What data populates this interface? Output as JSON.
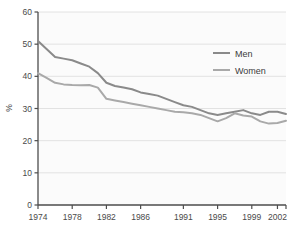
{
  "chart_data": {
    "type": "line",
    "title": "",
    "subtitle": "",
    "xlabel": "",
    "ylabel": "%",
    "xlim": [
      1974,
      2003
    ],
    "ylim": [
      0,
      60
    ],
    "ytick_values": [
      0,
      10,
      20,
      30,
      40,
      50,
      60
    ],
    "ytick_labels": [
      "0",
      "10",
      "20",
      "30",
      "40",
      "50",
      "60"
    ],
    "xtick_values": [
      1974,
      1978,
      1982,
      1986,
      1991,
      1995,
      1999,
      2002
    ],
    "xtick_labels": [
      "1974",
      "1978",
      "1982",
      "1986",
      "1991",
      "1995",
      "1999",
      "2002"
    ],
    "grid": "horizontal",
    "legend_position": "upper-right",
    "x": [
      1974,
      1975,
      1976,
      1977,
      1978,
      1979,
      1980,
      1981,
      1982,
      1983,
      1984,
      1985,
      1986,
      1987,
      1988,
      1989,
      1990,
      1991,
      1992,
      1993,
      1994,
      1995,
      1996,
      1997,
      1998,
      1999,
      2000,
      2001,
      2002,
      2003
    ],
    "series": [
      {
        "name": "Men",
        "color": "#8a8a8a",
        "values": [
          51,
          48.5,
          46,
          45.5,
          45,
          44,
          43,
          41,
          38,
          37,
          36.5,
          36,
          35,
          34.5,
          34,
          33,
          32,
          31,
          30.5,
          29.5,
          28.5,
          28,
          28.5,
          29,
          29.5,
          28.5,
          28,
          29,
          29,
          28.3
        ]
      },
      {
        "name": "Women",
        "color": "#a9a9a9",
        "values": [
          41,
          39.5,
          38,
          37.5,
          37.3,
          37.2,
          37.3,
          36.5,
          33,
          32.5,
          32,
          31.5,
          31,
          30.5,
          30,
          29.5,
          29,
          28.8,
          28.5,
          28,
          27,
          26,
          27,
          28.5,
          27.8,
          27.5,
          26,
          25.3,
          25.5,
          26.2
        ]
      }
    ]
  },
  "legend": {
    "entries": [
      {
        "label": "Men"
      },
      {
        "label": "Women"
      }
    ]
  }
}
